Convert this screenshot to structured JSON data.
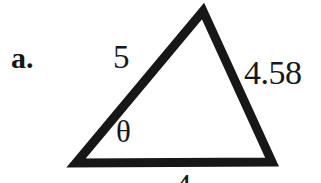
{
  "figure": {
    "item_label": "a.",
    "shape": "triangle",
    "stroke_color": "#171717",
    "fill_color": "#ffffff",
    "background_color": "#ffffff",
    "stroke_width": 9,
    "labels": {
      "side_left": "5",
      "side_right": "4.58",
      "side_bottom": "4",
      "angle": "θ"
    },
    "vertices": {
      "apex": [
        203,
        11
      ],
      "bottom_left": [
        76,
        163
      ],
      "bottom_right": [
        272,
        162
      ]
    }
  },
  "chart_data": {
    "type": "diagram",
    "title": "a.",
    "shape": "triangle",
    "vertices": [
      {
        "name": "apex",
        "x": 203,
        "y": 11
      },
      {
        "name": "bottom_left",
        "x": 76,
        "y": 163
      },
      {
        "name": "bottom_right",
        "x": 272,
        "y": 162
      }
    ],
    "edges": [
      {
        "name": "left-side",
        "from": "bottom_left",
        "to": "apex",
        "label": "5"
      },
      {
        "name": "right-side",
        "from": "apex",
        "to": "bottom_right",
        "label": "4.58"
      },
      {
        "name": "base",
        "from": "bottom_left",
        "to": "bottom_right",
        "label": "4"
      }
    ],
    "annotations": [
      {
        "name": "angle-theta",
        "label": "θ",
        "at_vertex": "bottom_left"
      }
    ],
    "xlabel": "",
    "ylabel": "",
    "grid": false,
    "legend": "none"
  }
}
